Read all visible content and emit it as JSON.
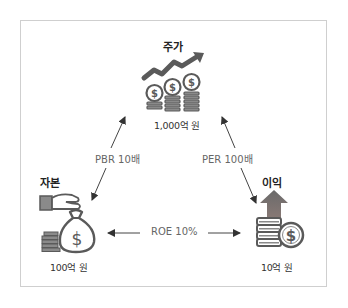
{
  "nodes": {
    "stock_price": {
      "title": "주가",
      "value": "1,000억 원",
      "icon": "stock-growth-coins-icon"
    },
    "capital": {
      "title": "자본",
      "value": "100억 원",
      "icon": "hand-money-bag-icon"
    },
    "earnings": {
      "title": "이익",
      "value": "10억 원",
      "icon": "coins-up-arrow-icon"
    }
  },
  "relations": {
    "pbr": {
      "label": "PBR 10배",
      "from": "capital",
      "to": "stock_price",
      "bidirectional": true
    },
    "per": {
      "label": "PER 100배",
      "from": "earnings",
      "to": "stock_price",
      "bidirectional": true
    },
    "roe": {
      "label": "ROE 10%",
      "from": "capital",
      "to": "earnings",
      "bidirectional": true
    }
  },
  "colors": {
    "icon_dark": "#5a5a5a",
    "icon_light": "#9a9a9a",
    "arrow": "#333333",
    "border": "#cfcfcf",
    "arrow_head_accent": "#7a6a66"
  }
}
